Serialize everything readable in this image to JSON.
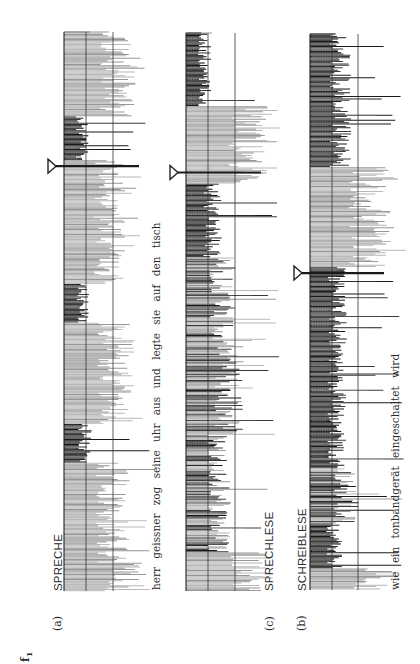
{
  "figure": {
    "label": "f",
    "label_sub": "1"
  },
  "panels": [
    {
      "id": "a",
      "tag": "(a)",
      "name": "SPRECHE",
      "caption": "herr geissner zog seine uhr aus und legte sie auf den tisch"
    },
    {
      "id": "c",
      "tag": "(c)",
      "name": "SPRECHLESE",
      "caption": ""
    },
    {
      "id": "b",
      "tag": "(b)",
      "name": "SCHREIBLESE",
      "caption": "wie ein tonbandgerät eingeschaltet wird"
    }
  ],
  "chart_data": [
    {
      "type": "bar",
      "orientation": "rotated-90-ccw",
      "title": "(a) SPRECHE",
      "caption": "herr geissner zog seine uhr aus und legte sie auf den tisch",
      "gridlines": 2,
      "marker": {
        "shape": "triangle",
        "position_fraction": 0.24
      },
      "seed": 11,
      "segments": [
        {
          "from": 0.0,
          "to": 0.15,
          "level": 0.85,
          "density": "light"
        },
        {
          "from": 0.15,
          "to": 0.23,
          "level": 0.28,
          "density": "dark"
        },
        {
          "from": 0.23,
          "to": 0.45,
          "level": 0.7,
          "density": "light"
        },
        {
          "from": 0.45,
          "to": 0.52,
          "level": 0.3,
          "density": "dark"
        },
        {
          "from": 0.52,
          "to": 0.7,
          "level": 0.8,
          "density": "light"
        },
        {
          "from": 0.7,
          "to": 0.77,
          "level": 0.32,
          "density": "dark"
        },
        {
          "from": 0.77,
          "to": 0.95,
          "level": 0.75,
          "density": "light"
        },
        {
          "from": 0.95,
          "to": 1.0,
          "level": 0.95,
          "density": "light"
        }
      ]
    },
    {
      "type": "bar",
      "orientation": "rotated-90-ccw",
      "title": "(c) SPRECHLESE",
      "caption": "",
      "gridlines": 2,
      "marker": {
        "shape": "triangle",
        "position_fraction": 0.25
      },
      "seed": 23,
      "segments": [
        {
          "from": 0.0,
          "to": 0.13,
          "level": 0.28,
          "density": "dark"
        },
        {
          "from": 0.13,
          "to": 0.27,
          "level": 0.95,
          "density": "light"
        },
        {
          "from": 0.27,
          "to": 0.4,
          "level": 0.4,
          "density": "dark"
        },
        {
          "from": 0.4,
          "to": 0.55,
          "level": 0.55,
          "density": "mixed"
        },
        {
          "from": 0.55,
          "to": 0.72,
          "level": 0.65,
          "density": "mixed"
        },
        {
          "from": 0.72,
          "to": 0.93,
          "level": 0.5,
          "density": "mixed"
        },
        {
          "from": 0.93,
          "to": 1.0,
          "level": 0.98,
          "density": "light"
        }
      ]
    },
    {
      "type": "bar",
      "orientation": "rotated-90-ccw",
      "title": "(b) SCHREIBLESE",
      "caption": "wie ein tonbandgerät eingeschaltet wird",
      "gridlines": 2,
      "marker": {
        "shape": "triangle",
        "position_fraction": 0.43
      },
      "seed": 37,
      "segments": [
        {
          "from": 0.0,
          "to": 0.24,
          "level": 0.45,
          "density": "dark"
        },
        {
          "from": 0.24,
          "to": 0.42,
          "level": 0.88,
          "density": "light"
        },
        {
          "from": 0.42,
          "to": 0.5,
          "level": 0.4,
          "density": "dark"
        },
        {
          "from": 0.5,
          "to": 0.78,
          "level": 0.4,
          "density": "dark"
        },
        {
          "from": 0.78,
          "to": 0.88,
          "level": 0.55,
          "density": "mixed"
        },
        {
          "from": 0.88,
          "to": 0.96,
          "level": 0.35,
          "density": "dark"
        },
        {
          "from": 0.96,
          "to": 1.0,
          "level": 0.98,
          "density": "light"
        }
      ]
    }
  ]
}
